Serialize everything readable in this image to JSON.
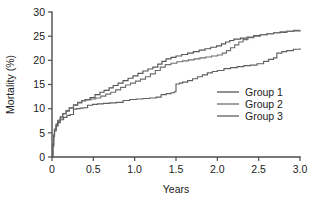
{
  "chart_data": {
    "type": "line",
    "title": "",
    "subtitle": "",
    "xlabel": "Years",
    "ylabel": "Mortality (%)",
    "xlim": [
      0,
      3.0
    ],
    "ylim": [
      0,
      30
    ],
    "xticks": [
      "0",
      "0.5",
      "1.0",
      "1.5",
      "2.0",
      "2.5",
      "3.0"
    ],
    "xtick_values": [
      0,
      0.5,
      1.0,
      1.5,
      2.0,
      2.5,
      3.0
    ],
    "yticks": [
      "0",
      "5",
      "10",
      "15",
      "20",
      "25",
      "30"
    ],
    "ytick_values": [
      0,
      5,
      10,
      15,
      20,
      25,
      30
    ],
    "grid": false,
    "legend_position": "right-middle",
    "step_style": "post",
    "series": [
      {
        "name": "Group 1",
        "color": "#555555",
        "points": [
          [
            0.0,
            0.0
          ],
          [
            0.01,
            2.6
          ],
          [
            0.02,
            4.6
          ],
          [
            0.03,
            5.8
          ],
          [
            0.05,
            6.8
          ],
          [
            0.07,
            7.6
          ],
          [
            0.1,
            8.3
          ],
          [
            0.13,
            9.0
          ],
          [
            0.17,
            9.6
          ],
          [
            0.21,
            10.2
          ],
          [
            0.26,
            10.8
          ],
          [
            0.31,
            11.3
          ],
          [
            0.36,
            11.7
          ],
          [
            0.4,
            11.9
          ],
          [
            0.46,
            12.3
          ],
          [
            0.52,
            12.9
          ],
          [
            0.58,
            13.4
          ],
          [
            0.63,
            13.8
          ],
          [
            0.69,
            14.3
          ],
          [
            0.74,
            14.8
          ],
          [
            0.8,
            15.3
          ],
          [
            0.86,
            15.8
          ],
          [
            0.92,
            16.3
          ],
          [
            0.98,
            16.8
          ],
          [
            1.04,
            17.3
          ],
          [
            1.1,
            17.8
          ],
          [
            1.16,
            18.2
          ],
          [
            1.22,
            18.6
          ],
          [
            1.28,
            19.2
          ],
          [
            1.33,
            19.8
          ],
          [
            1.38,
            20.3
          ],
          [
            1.44,
            20.6
          ],
          [
            1.5,
            20.9
          ],
          [
            1.57,
            21.2
          ],
          [
            1.64,
            21.5
          ],
          [
            1.71,
            21.8
          ],
          [
            1.78,
            22.1
          ],
          [
            1.85,
            22.4
          ],
          [
            1.92,
            22.7
          ],
          [
            1.99,
            23.0
          ],
          [
            2.05,
            23.4
          ],
          [
            2.1,
            23.8
          ],
          [
            2.15,
            24.1
          ],
          [
            2.2,
            24.4
          ],
          [
            2.28,
            24.6
          ],
          [
            2.36,
            24.8
          ],
          [
            2.44,
            25.1
          ],
          [
            2.52,
            25.3
          ],
          [
            2.6,
            25.5
          ],
          [
            2.68,
            25.7
          ],
          [
            2.76,
            25.8
          ],
          [
            2.84,
            26.0
          ],
          [
            2.92,
            26.1
          ],
          [
            3.0,
            26.2
          ]
        ]
      },
      {
        "name": "Group 2",
        "color": "#6f6f6f",
        "points": [
          [
            0.0,
            0.0
          ],
          [
            0.01,
            2.4
          ],
          [
            0.02,
            4.4
          ],
          [
            0.03,
            5.6
          ],
          [
            0.05,
            6.6
          ],
          [
            0.07,
            7.4
          ],
          [
            0.1,
            8.1
          ],
          [
            0.13,
            8.9
          ],
          [
            0.17,
            9.5
          ],
          [
            0.21,
            10.1
          ],
          [
            0.26,
            10.7
          ],
          [
            0.31,
            11.2
          ],
          [
            0.36,
            11.6
          ],
          [
            0.41,
            11.8
          ],
          [
            0.47,
            12.0
          ],
          [
            0.53,
            12.2
          ],
          [
            0.59,
            12.6
          ],
          [
            0.65,
            13.0
          ],
          [
            0.71,
            13.4
          ],
          [
            0.77,
            13.9
          ],
          [
            0.83,
            14.4
          ],
          [
            0.89,
            14.9
          ],
          [
            0.95,
            15.3
          ],
          [
            1.01,
            15.7
          ],
          [
            1.07,
            16.1
          ],
          [
            1.13,
            16.6
          ],
          [
            1.19,
            17.2
          ],
          [
            1.25,
            17.9
          ],
          [
            1.31,
            18.6
          ],
          [
            1.37,
            19.1
          ],
          [
            1.44,
            19.4
          ],
          [
            1.51,
            19.7
          ],
          [
            1.58,
            19.9
          ],
          [
            1.65,
            20.1
          ],
          [
            1.72,
            20.3
          ],
          [
            1.79,
            20.5
          ],
          [
            1.86,
            20.7
          ],
          [
            1.93,
            20.9
          ],
          [
            2.0,
            21.1
          ],
          [
            2.06,
            21.5
          ],
          [
            2.11,
            22.0
          ],
          [
            2.16,
            22.6
          ],
          [
            2.21,
            23.2
          ],
          [
            2.26,
            23.8
          ],
          [
            2.31,
            24.3
          ],
          [
            2.37,
            24.7
          ],
          [
            2.44,
            25.0
          ],
          [
            2.52,
            25.3
          ],
          [
            2.6,
            25.5
          ],
          [
            2.68,
            25.7
          ],
          [
            2.76,
            25.9
          ],
          [
            2.84,
            26.0
          ],
          [
            2.92,
            26.2
          ],
          [
            3.0,
            26.3
          ]
        ]
      },
      {
        "name": "Group 3",
        "color": "#606060",
        "points": [
          [
            0.0,
            0.0
          ],
          [
            0.01,
            2.2
          ],
          [
            0.02,
            4.2
          ],
          [
            0.03,
            5.4
          ],
          [
            0.05,
            6.4
          ],
          [
            0.07,
            7.1
          ],
          [
            0.1,
            7.7
          ],
          [
            0.14,
            8.2
          ],
          [
            0.18,
            8.6
          ],
          [
            0.22,
            8.8
          ],
          [
            0.26,
            9.9
          ],
          [
            0.3,
            10.0
          ],
          [
            0.34,
            10.1
          ],
          [
            0.38,
            10.2
          ],
          [
            0.43,
            10.7
          ],
          [
            0.49,
            10.9
          ],
          [
            0.55,
            11.0
          ],
          [
            0.62,
            11.1
          ],
          [
            0.7,
            11.2
          ],
          [
            0.78,
            11.3
          ],
          [
            0.86,
            11.7
          ],
          [
            0.94,
            11.9
          ],
          [
            1.02,
            12.0
          ],
          [
            1.1,
            12.1
          ],
          [
            1.18,
            12.2
          ],
          [
            1.26,
            12.4
          ],
          [
            1.32,
            12.9
          ],
          [
            1.38,
            13.1
          ],
          [
            1.44,
            13.3
          ],
          [
            1.48,
            13.5
          ],
          [
            1.5,
            15.1
          ],
          [
            1.54,
            15.3
          ],
          [
            1.58,
            15.5
          ],
          [
            1.64,
            15.8
          ],
          [
            1.7,
            16.2
          ],
          [
            1.76,
            16.6
          ],
          [
            1.82,
            17.0
          ],
          [
            1.88,
            17.4
          ],
          [
            1.94,
            17.7
          ],
          [
            2.0,
            17.9
          ],
          [
            2.08,
            18.3
          ],
          [
            2.16,
            18.5
          ],
          [
            2.24,
            18.7
          ],
          [
            2.32,
            18.9
          ],
          [
            2.4,
            19.0
          ],
          [
            2.48,
            19.3
          ],
          [
            2.56,
            19.8
          ],
          [
            2.62,
            20.2
          ],
          [
            2.68,
            20.5
          ],
          [
            2.72,
            21.5
          ],
          [
            2.78,
            21.8
          ],
          [
            2.84,
            22.0
          ],
          [
            2.92,
            22.3
          ],
          [
            3.0,
            22.5
          ]
        ]
      }
    ]
  },
  "legend": {
    "items": [
      {
        "label": "Group 1",
        "color": "#555555"
      },
      {
        "label": "Group 2",
        "color": "#6f6f6f"
      },
      {
        "label": "Group 3",
        "color": "#606060"
      }
    ]
  }
}
